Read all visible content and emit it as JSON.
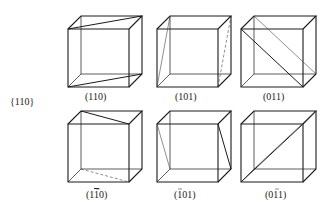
{
  "figure": {
    "family_label": "{110}",
    "cube_geometry": {
      "width": 61,
      "height": 58,
      "depth_dx": 13,
      "depth_dy": -13
    },
    "cubes": [
      {
        "label": "(110)",
        "origin": [
          68,
          29
        ],
        "label_pos": [
          96,
          99
        ],
        "plane_lines": [
          {
            "from": "ftl",
            "to": "btr",
            "style": "solid"
          },
          {
            "from": "fbl",
            "to": "bbr",
            "style": "solid"
          }
        ]
      },
      {
        "label": "(101)",
        "origin": [
          157,
          29
        ],
        "label_pos": [
          186,
          99
        ],
        "plane_lines": [
          {
            "from": "fbl",
            "to": "btl",
            "style": "thin"
          },
          {
            "from": "fbr",
            "to": "btr",
            "style": "dashed"
          }
        ]
      },
      {
        "label": "(011)",
        "origin": [
          241,
          29
        ],
        "label_pos": [
          275,
          99
        ],
        "plane_lines": [
          {
            "from": "ftl",
            "to": "fbr",
            "style": "solid"
          },
          {
            "from": "btl",
            "to": "bbr",
            "style": "thin"
          }
        ]
      },
      {
        "label": "(1̄1̄0)",
        "label_parts": [
          "(1",
          "1",
          "0)"
        ],
        "label_overbar_index": 1,
        "origin": [
          68,
          124
        ],
        "label_pos": [
          98,
          197
        ],
        "plane_lines": [
          {
            "from": "btl",
            "to": "ftr",
            "style": "solid"
          },
          {
            "from": "bbl",
            "to": "fbr",
            "style": "dashed"
          }
        ]
      },
      {
        "label": "(̄1 01)",
        "label_parts": [
          "(",
          "1",
          "01)"
        ],
        "label_overbar_index": 1,
        "origin": [
          157,
          124
        ],
        "label_pos": [
          183,
          197
        ],
        "plane_lines": [
          {
            "from": "ftl",
            "to": "bbl",
            "style": "thin"
          },
          {
            "from": "ftr",
            "to": "bbr",
            "style": "solid"
          }
        ]
      },
      {
        "label": "(01̄1)",
        "label_parts": [
          "(0",
          "1",
          "1)"
        ],
        "label_overbar_index": 1,
        "origin": [
          241,
          124
        ],
        "label_pos": [
          277,
          197
        ],
        "plane_lines": [
          {
            "from": "fbl",
            "to": "ftr",
            "style": "solid"
          },
          {
            "from": "bbl",
            "to": "btr",
            "style": "thin"
          }
        ]
      }
    ],
    "labels": {
      "family": "{110}",
      "c1": "(110)",
      "c2": "(101)",
      "c3": "(011)",
      "c4_a": "(1",
      "c4_b": "1",
      "c4_c": "0)",
      "c5_a": "(",
      "c5_b": "1",
      "c5_c": "01)",
      "c6_a": "(0",
      "c6_b": "1",
      "c6_c": "1)"
    },
    "colors": {
      "line": "#1a1a1a",
      "background": "#ffffff",
      "text": "#222222"
    }
  }
}
